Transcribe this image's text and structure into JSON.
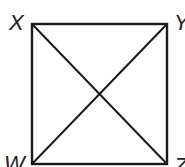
{
  "diagram": {
    "type": "square-with-diagonals",
    "stroke_color": "#1a1a1a",
    "vertices": {
      "top_left": "X",
      "top_right": "Y",
      "bottom_left": "W",
      "bottom_right": "Z"
    },
    "segments": [
      "XY",
      "YZ",
      "ZW",
      "WX",
      "XZ",
      "YW"
    ]
  }
}
